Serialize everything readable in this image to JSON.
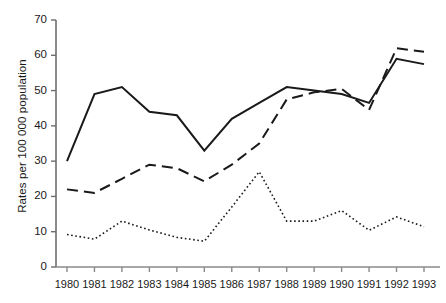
{
  "chart_data": {
    "type": "line",
    "title": "",
    "subtitle": "",
    "xlabel": "",
    "ylabel": "Rates per 100 000 population",
    "categories": [
      "1980",
      "1981",
      "1982",
      "1983",
      "1984",
      "1985",
      "1986",
      "1987",
      "1988",
      "1989",
      "1990",
      "1991",
      "1992",
      "1993"
    ],
    "x": [
      1980,
      1981,
      1982,
      1983,
      1984,
      1985,
      1986,
      1987,
      1988,
      1989,
      1990,
      1991,
      1992,
      1993
    ],
    "ylim": [
      0,
      70
    ],
    "yticks": [
      0,
      10,
      20,
      30,
      40,
      50,
      60,
      70
    ],
    "ytick_labels": [
      "0",
      "10",
      "20",
      "30",
      "40",
      "50",
      "60",
      "70"
    ],
    "xlim": [
      1980,
      1993
    ],
    "grid": false,
    "legend": "none",
    "series": [
      {
        "name": "solid-series",
        "style": "solid",
        "color": "#1a1a1a",
        "values": [
          30,
          49,
          51,
          44,
          43,
          33,
          42,
          46.5,
          51,
          50,
          49,
          46.5,
          59,
          57.5
        ]
      },
      {
        "name": "dashed-series",
        "style": "dashed",
        "color": "#1a1a1a",
        "values": [
          22,
          21,
          25,
          29,
          28,
          24.3,
          29,
          35,
          47.5,
          49.5,
          50.5,
          44.5,
          62,
          61
        ]
      },
      {
        "name": "dotted-series",
        "style": "dotted",
        "color": "#1a1a1a",
        "values": [
          9.2,
          7.9,
          13,
          10.5,
          8.4,
          7.3,
          17,
          27,
          13,
          13,
          16,
          10.4,
          14.2,
          11.4
        ]
      }
    ]
  },
  "axes": {
    "y_title": "Rates per 100 000 population"
  }
}
